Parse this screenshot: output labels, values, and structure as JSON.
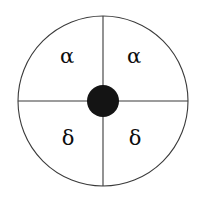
{
  "figure": {
    "type": "quadrant-circle-diagram",
    "background_color": "#ffffff",
    "outline_color": "#3a3a3a",
    "hub_color": "#141414",
    "label_color": "#0d0d0d",
    "circle": {
      "center_x": 103,
      "center_y": 101,
      "radius": 85,
      "stroke_width": 1
    },
    "hub": {
      "center_x": 103,
      "center_y": 101,
      "radius": 16
    },
    "axes": {
      "vertical": {
        "x": 103,
        "y_top": 16,
        "y_bottom": 186
      },
      "horizontal": {
        "y": 101,
        "x_left": 18,
        "x_right": 188
      }
    },
    "quadrants": [
      {
        "position": "top-left",
        "label": "α"
      },
      {
        "position": "top-right",
        "label": "α"
      },
      {
        "position": "bottom-left",
        "label": "δ"
      },
      {
        "position": "bottom-right",
        "label": "δ"
      }
    ]
  }
}
